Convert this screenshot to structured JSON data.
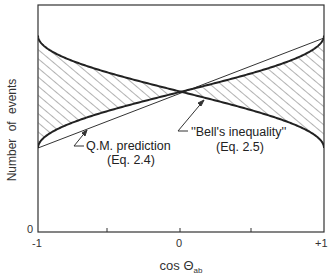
{
  "chart_data": {
    "type": "line",
    "title": "",
    "xlabel": "cos Θ_ab",
    "xlabel_main": "cos Θ",
    "xlabel_sub": "ab",
    "ylabel": "Number of events",
    "xlim": [
      -1,
      1
    ],
    "ylim": [
      0,
      1
    ],
    "x_tick_labels": [
      "-1",
      "0",
      "+1"
    ],
    "x_minor_ticks": [
      -0.5,
      0.5
    ],
    "y_tick_labels": [
      "0"
    ],
    "grid": false,
    "legend": null,
    "series": [
      {
        "name": "Q.M. curve (rising)",
        "style": "thick curve",
        "x": [
          -1,
          -0.9,
          -0.5,
          0,
          0.5,
          0.9,
          1
        ],
        "values": [
          0.0,
          0.14,
          0.33,
          0.5,
          0.67,
          0.86,
          1.0
        ]
      },
      {
        "name": "Q.M. curve (falling)",
        "style": "thick curve",
        "x": [
          -1,
          -0.9,
          -0.5,
          0,
          0.5,
          0.9,
          1
        ],
        "values": [
          1.0,
          0.86,
          0.67,
          0.5,
          0.33,
          0.14,
          0.0
        ]
      },
      {
        "name": "Straight line bound",
        "style": "thin line",
        "x": [
          -1,
          0,
          1
        ],
        "values": [
          0.0,
          0.5,
          1.0
        ]
      }
    ],
    "shaded_region": "hatched area between the two thick curves",
    "annotations": [
      {
        "text": "Q.M. prediction",
        "sub": "(Eq. 2.4)",
        "arrow_to": "lower-left curves near cosΘ≈-0.65"
      },
      {
        "text": "''Bell's inequality''",
        "sub": "(Eq. 2.5)",
        "arrow_to": "crossing region near cosΘ≈0.15"
      }
    ]
  },
  "labels": {
    "y_axis": "Number of events",
    "y_zero": "0",
    "x_axis_main": "cos Θ",
    "x_axis_sub": "ab",
    "x_ticks": [
      "-1",
      "0",
      "+1"
    ],
    "qm_label": "Q.M. prediction",
    "qm_eq": "(Eq. 2.4)",
    "bell_label": "''Bell's inequality''",
    "bell_eq": "(Eq. 2.5)"
  }
}
